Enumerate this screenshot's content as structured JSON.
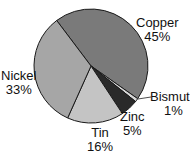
{
  "chart_data": {
    "type": "pie",
    "title": "",
    "start_angle_deg": 323,
    "center": [
      91,
      66
    ],
    "radius": 57,
    "slices": [
      {
        "name": "Copper",
        "value": 45,
        "label": "Copper",
        "pct": "45%",
        "color": "#7a7a7a"
      },
      {
        "name": "Bismuth",
        "value": 1,
        "label": "Bismuth",
        "pct": "1%",
        "color": "#d8d8d8"
      },
      {
        "name": "Zinc",
        "value": 5,
        "label": "Zinc",
        "pct": "5%",
        "color": "#2a2a2a"
      },
      {
        "name": "Tin",
        "value": 16,
        "label": "Tin",
        "pct": "16%",
        "color": "#c4c4c4"
      },
      {
        "name": "Nickel",
        "value": 33,
        "label": "Nickel",
        "pct": "33%",
        "color": "#a6a6a6"
      }
    ]
  },
  "labels": {
    "copper": {
      "name": "Copper",
      "pct": "45%"
    },
    "bismuth": {
      "name": "Bismuth",
      "pct": "1%"
    },
    "zinc": {
      "name": "Zinc",
      "pct": "5%"
    },
    "tin": {
      "name": "Tin",
      "pct": "16%"
    },
    "nickel": {
      "name": "Nickel",
      "pct": "33%"
    }
  }
}
